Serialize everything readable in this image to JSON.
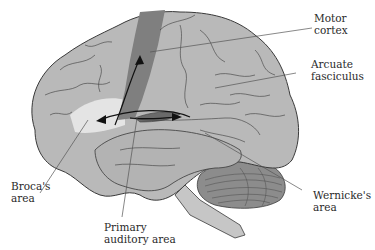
{
  "labels": {
    "motor_cortex": "Motor\ncortex",
    "arcuate_fasciculus": "Arcuate\nfasciculus",
    "brocas_area": "Broca's\narea",
    "primary_auditory_area": "Primary\nauditory area",
    "wernickes_area": "Wernicke's\narea"
  },
  "colors": {
    "brain_fill": "#b9b9b9",
    "brain_outline": "#3a3a3a",
    "motor_cortex": "#7f7f7f",
    "brocas_area": "#e4e4e4",
    "auditory_area": "#6a6a6a",
    "cerebellum": "#8c8c8c",
    "leader_line": "#555555"
  }
}
